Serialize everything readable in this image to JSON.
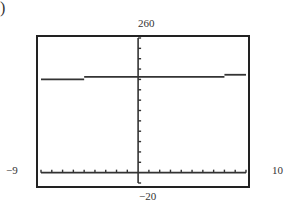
{
  "figure_label": ")",
  "window": {
    "xmin_label": "−9",
    "xmax_label": "10",
    "ymin_label": "−20",
    "ymax_label": "260",
    "colors": {
      "frame": "#222222",
      "line": "#333333",
      "background": "#ffffff"
    }
  },
  "chart_data": {
    "type": "line",
    "title": "",
    "xlabel": "",
    "ylabel": "",
    "xlim": [
      -9,
      10
    ],
    "ylim": [
      -20,
      260
    ],
    "grid": false,
    "legend": null,
    "x_ticks_every": 1,
    "y_ticks_every": 20,
    "series": [
      {
        "name": "step function",
        "style": "step",
        "segments": [
          {
            "x": [
              -9,
              -5
            ],
            "y": 180
          },
          {
            "x": [
              -5,
              8
            ],
            "y": 185
          },
          {
            "x": [
              8,
              10
            ],
            "y": 189
          }
        ]
      }
    ],
    "annotations": [
      "-9",
      "10",
      "-20",
      "260"
    ]
  }
}
